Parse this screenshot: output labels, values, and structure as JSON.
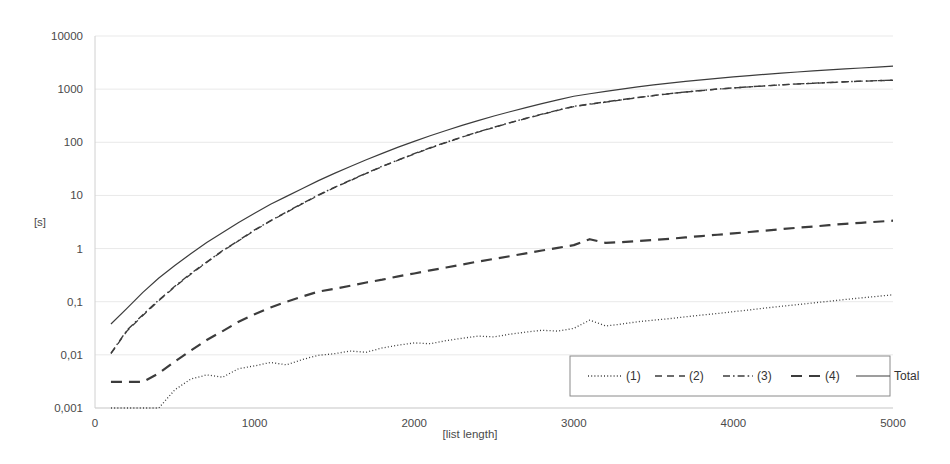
{
  "chart_data": {
    "type": "line",
    "title": "",
    "xlabel": "[list length]",
    "ylabel": "[s]",
    "xlim": [
      0,
      5000
    ],
    "ylim": [
      0.001,
      10000
    ],
    "yscale": "log",
    "xscale": "linear",
    "grid": true,
    "legend_position": "inside-bottom-right",
    "x_ticks": [
      "0",
      "1000",
      "2000",
      "3000",
      "4000",
      "5000"
    ],
    "x_tick_values": [
      0,
      1000,
      2000,
      3000,
      4000,
      5000
    ],
    "y_ticks": [
      "0,001",
      "0,01",
      "0,1",
      "1",
      "10",
      "100",
      "1000",
      "10000"
    ],
    "y_tick_values": [
      0.001,
      0.01,
      0.1,
      1,
      10,
      100,
      1000,
      10000
    ],
    "x": [
      100,
      200,
      300,
      400,
      500,
      600,
      700,
      800,
      900,
      1000,
      1100,
      1200,
      1300,
      1400,
      1500,
      1600,
      1700,
      1800,
      1900,
      2000,
      2100,
      2200,
      2300,
      2400,
      2500,
      2600,
      2700,
      2800,
      2900,
      3000,
      3100,
      3200,
      3300,
      3400,
      3500,
      3600,
      3700,
      3800,
      3900,
      4000,
      4100,
      4200,
      4300,
      4400,
      4500,
      4600,
      4700,
      4800,
      4900,
      5000
    ],
    "series": [
      {
        "name": "(1)",
        "dash": "dotted",
        "values": [
          0.001,
          0.001,
          0.001,
          0.001,
          0.0022,
          0.0035,
          0.0042,
          0.0038,
          0.0055,
          0.0062,
          0.0072,
          0.0065,
          0.0082,
          0.0098,
          0.0105,
          0.0118,
          0.0112,
          0.0135,
          0.0152,
          0.0168,
          0.0162,
          0.0185,
          0.0205,
          0.0225,
          0.0218,
          0.0245,
          0.0268,
          0.029,
          0.028,
          0.0315,
          0.045,
          0.035,
          0.038,
          0.042,
          0.045,
          0.048,
          0.052,
          0.056,
          0.06,
          0.065,
          0.07,
          0.076,
          0.082,
          0.088,
          0.095,
          0.102,
          0.11,
          0.118,
          0.126,
          0.135
        ]
      },
      {
        "name": "(2)",
        "dash": "dashed",
        "values": [
          0.0105,
          0.028,
          0.055,
          0.105,
          0.19,
          0.33,
          0.55,
          0.9,
          1.4,
          2.2,
          3.3,
          4.8,
          7.0,
          10.0,
          14.0,
          19.0,
          26.0,
          35.0,
          46.0,
          60.0,
          78.0,
          99.0,
          125.0,
          155.0,
          190.0,
          232.0,
          280.0,
          335.0,
          400.0,
          470.0,
          520.0,
          570.0,
          630.0,
          690.0,
          755.0,
          820.0,
          880.0,
          940.0,
          1000.0,
          1050.0,
          1100.0,
          1150.0,
          1200.0,
          1250.0,
          1290.0,
          1330.0,
          1370.0,
          1410.0,
          1440.0,
          1470.0
        ]
      },
      {
        "name": "(3)",
        "dash": "dashdot",
        "values": [
          0.0108,
          0.029,
          0.057,
          0.108,
          0.195,
          0.34,
          0.56,
          0.92,
          1.42,
          2.25,
          3.35,
          4.9,
          7.1,
          10.2,
          14.2,
          19.3,
          26.3,
          35.5,
          46.5,
          61.0,
          79.0,
          100.0,
          126.0,
          157.0,
          192.0,
          235.0,
          283.0,
          338.0,
          404.0,
          475.0,
          525.0,
          575.0,
          635.0,
          696.0,
          760.0,
          825.0,
          885.0,
          945.0,
          1005.0,
          1055.0,
          1105.0,
          1155.0,
          1205.0,
          1255.0,
          1295.0,
          1335.0,
          1375.0,
          1415.0,
          1445.0,
          1475.0
        ]
      },
      {
        "name": "(4)",
        "dash": "longdash",
        "values": [
          0.0031,
          0.0031,
          0.0031,
          0.0045,
          0.0075,
          0.012,
          0.019,
          0.028,
          0.042,
          0.058,
          0.078,
          0.1,
          0.125,
          0.155,
          0.175,
          0.2,
          0.23,
          0.26,
          0.3,
          0.34,
          0.39,
          0.44,
          0.5,
          0.57,
          0.64,
          0.72,
          0.81,
          0.92,
          1.03,
          1.16,
          1.5,
          1.28,
          1.32,
          1.38,
          1.45,
          1.53,
          1.62,
          1.72,
          1.82,
          1.93,
          2.05,
          2.18,
          2.32,
          2.46,
          2.6,
          2.76,
          2.92,
          3.05,
          3.2,
          3.35
        ]
      },
      {
        "name": "Total",
        "dash": "solid",
        "values": [
          0.038,
          0.075,
          0.15,
          0.28,
          0.48,
          0.8,
          1.3,
          2.0,
          3.1,
          4.6,
          6.8,
          9.6,
          13.5,
          19.0,
          26.0,
          35.0,
          47.0,
          62.0,
          81.0,
          104.0,
          133.0,
          167.0,
          208.0,
          256.0,
          312.0,
          376.0,
          450.0,
          535.0,
          630.0,
          735.0,
          820.0,
          905.0,
          1000.0,
          1100.0,
          1200.0,
          1300.0,
          1400.0,
          1500.0,
          1600.0,
          1700.0,
          1800.0,
          1900.0,
          2000.0,
          2100.0,
          2200.0,
          2300.0,
          2400.0,
          2500.0,
          2600.0,
          2700.0
        ]
      }
    ]
  },
  "legend": {
    "items": [
      {
        "label": "(1)",
        "dash": "dotted"
      },
      {
        "label": "(2)",
        "dash": "dashed"
      },
      {
        "label": "(3)",
        "dash": "dashdot"
      },
      {
        "label": "(4)",
        "dash": "longdash"
      },
      {
        "label": "Total",
        "dash": "solid"
      }
    ]
  },
  "style": {
    "series_color": "#3c3c3c",
    "grid_color": "#e9e9e9",
    "axis_color": "#d0d0d0",
    "text_color": "#4a4a4a",
    "background": "#ffffff"
  }
}
